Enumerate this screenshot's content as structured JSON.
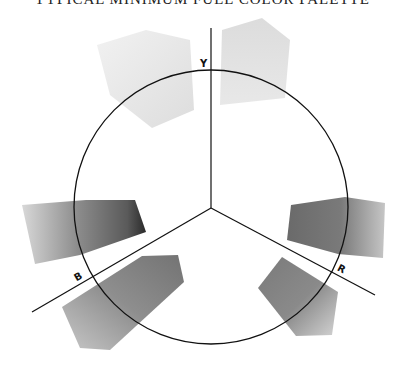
{
  "title": "TYPICAL MINIMUM FULL COLOR PALETTE",
  "diagram": {
    "type": "color-wheel-with-axes",
    "circle": {
      "cx": 211,
      "cy": 207,
      "r": 137
    },
    "axes": [
      {
        "label": "Y",
        "name": "yellow-axis"
      },
      {
        "label": "R",
        "name": "red-axis"
      },
      {
        "label": "B",
        "name": "blue-axis"
      }
    ],
    "swatches": [
      {
        "name": "swatch-yellow-left",
        "color_dark": "#d8d8d8",
        "color_light": "#ececec"
      },
      {
        "name": "swatch-yellow-right",
        "color_dark": "#cfcfcf",
        "color_light": "#e6e6e6"
      },
      {
        "name": "swatch-red-upper",
        "color_dark": "#6e6e6e",
        "color_light": "#bdbdbd"
      },
      {
        "name": "swatch-red-lower",
        "color_dark": "#7d7d7d",
        "color_light": "#cfcfcf"
      },
      {
        "name": "swatch-blue-upper",
        "color_dark": "#2e2e2e",
        "color_light": "#d6d6d6"
      },
      {
        "name": "swatch-blue-lower",
        "color_dark": "#7a7a7a",
        "color_light": "#c4c4c4"
      }
    ]
  }
}
